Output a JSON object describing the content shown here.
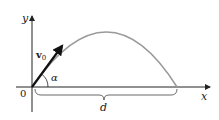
{
  "diagram": {
    "labels": {
      "y_axis": "y",
      "x_axis": "x",
      "origin": "0",
      "velocity": "v",
      "velocity_sub": "0",
      "angle": "α",
      "range": "d"
    },
    "colors": {
      "axes": "#222222",
      "trajectory": "#9a9a9a",
      "vector": "#111111",
      "background": "#ffffff"
    }
  }
}
